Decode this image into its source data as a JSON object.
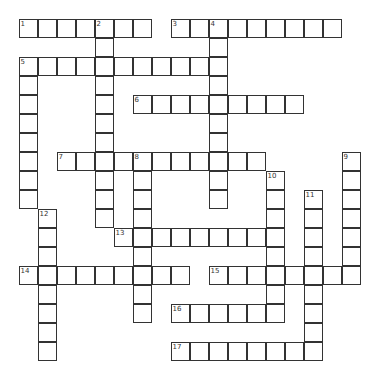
{
  "puzzle": {
    "origin": {
      "x": 19,
      "y": 19
    },
    "cell_size": 19,
    "entries": [
      {
        "number": "1",
        "direction": "across",
        "row": 0,
        "col": 0,
        "length": 7
      },
      {
        "number": "2",
        "direction": "down",
        "row": 0,
        "col": 4,
        "length": 11
      },
      {
        "number": "3",
        "direction": "across",
        "row": 0,
        "col": 8,
        "length": 9
      },
      {
        "number": "4",
        "direction": "down",
        "row": 0,
        "col": 10,
        "length": 10
      },
      {
        "number": "5",
        "direction": "across",
        "row": 2,
        "col": 0,
        "length": 11
      },
      {
        "number": "5",
        "direction": "down",
        "row": 2,
        "col": 0,
        "length": 8
      },
      {
        "number": "6",
        "direction": "across",
        "row": 4,
        "col": 6,
        "length": 9
      },
      {
        "number": "7",
        "direction": "across",
        "row": 7,
        "col": 2,
        "length": 11
      },
      {
        "number": "8",
        "direction": "down",
        "row": 7,
        "col": 6,
        "length": 9
      },
      {
        "number": "9",
        "direction": "down",
        "row": 7,
        "col": 17,
        "length": 7
      },
      {
        "number": "10",
        "direction": "down",
        "row": 8,
        "col": 13,
        "length": 8
      },
      {
        "number": "11",
        "direction": "down",
        "row": 9,
        "col": 15,
        "length": 9
      },
      {
        "number": "12",
        "direction": "down",
        "row": 10,
        "col": 1,
        "length": 8
      },
      {
        "number": "13",
        "direction": "across",
        "row": 11,
        "col": 5,
        "length": 9
      },
      {
        "number": "14",
        "direction": "across",
        "row": 13,
        "col": 0,
        "length": 9
      },
      {
        "number": "15",
        "direction": "across",
        "row": 13,
        "col": 10,
        "length": 8
      },
      {
        "number": "16",
        "direction": "across",
        "row": 15,
        "col": 8,
        "length": 6
      },
      {
        "number": "17",
        "direction": "across",
        "row": 17,
        "col": 8,
        "length": 8
      }
    ]
  }
}
